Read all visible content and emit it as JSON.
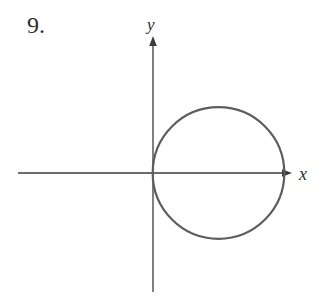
{
  "figure": {
    "problem_number": "9.",
    "background_color": "#ffffff",
    "axes": {
      "color": "#3b3b3b",
      "stroke_width": 1.3,
      "x_label": "x",
      "y_label": "y",
      "x_axis": {
        "x1": 18,
        "y1": 173,
        "x2": 285,
        "y2": 173
      },
      "y_axis": {
        "x1": 153,
        "y1": 44,
        "x2": 153,
        "y2": 292
      },
      "x_arrowhead_points": "292,173 282,169.2 282,176.8",
      "y_arrowhead_points": "153,36 149.2,46 156.8,46"
    },
    "circle": {
      "cx": 218.5,
      "cy": 173,
      "r": 65.8,
      "stroke_color": "#5d5d5d",
      "stroke_width": 2.2,
      "fill": "none",
      "tangent_point": "origin",
      "center_location": "positive x-axis"
    }
  }
}
